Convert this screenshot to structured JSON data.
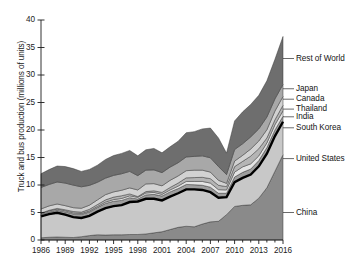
{
  "chart_data": {
    "type": "area",
    "title": "",
    "xlabel": "",
    "ylabel": "Truck and bus production (millions of units)",
    "xlim": [
      1986,
      2016
    ],
    "ylim": [
      0,
      40
    ],
    "ytick_labels": [
      "0",
      "5",
      "10",
      "15",
      "20",
      "25",
      "30",
      "35",
      "40"
    ],
    "ytick_values": [
      0,
      5,
      10,
      15,
      20,
      25,
      30,
      35,
      40
    ],
    "xtick_labels": [
      "1986",
      "1989",
      "1992",
      "1995",
      "1998",
      "2001",
      "2004",
      "2007",
      "2010",
      "2013",
      "2016"
    ],
    "xtick_values": [
      1986,
      1989,
      1992,
      1995,
      1998,
      2001,
      2004,
      2007,
      2010,
      2013,
      2016
    ],
    "grid": false,
    "legend_position": "right",
    "stacked": true,
    "x": [
      1986,
      1987,
      1988,
      1989,
      1990,
      1991,
      1992,
      1993,
      1994,
      1995,
      1996,
      1997,
      1998,
      1999,
      2000,
      2001,
      2002,
      2003,
      2004,
      2005,
      2006,
      2007,
      2008,
      2009,
      2010,
      2011,
      2012,
      2013,
      2014,
      2015,
      2016
    ],
    "series": [
      {
        "name": "China",
        "color": "#8a8a8a",
        "values": [
          0.4,
          0.5,
          0.55,
          0.5,
          0.45,
          0.6,
          0.8,
          0.95,
          0.9,
          0.95,
          0.95,
          1.0,
          1.0,
          1.1,
          1.3,
          1.5,
          1.9,
          2.3,
          2.5,
          2.4,
          2.9,
          3.3,
          3.4,
          4.6,
          6.1,
          6.3,
          6.4,
          7.6,
          9.5,
          12.5,
          15.5
        ]
      },
      {
        "name": "United States",
        "color": "#c8c8c8",
        "values": [
          3.9,
          4.2,
          4.4,
          4.1,
          3.7,
          3.4,
          3.6,
          4.2,
          4.9,
          5.2,
          5.4,
          5.9,
          6.0,
          6.4,
          6.2,
          5.7,
          6.0,
          6.2,
          6.7,
          6.8,
          6.2,
          5.4,
          4.3,
          3.2,
          4.4,
          5.0,
          5.5,
          5.8,
          6.2,
          6.4,
          6.0
        ]
      },
      {
        "name": "South Korea",
        "color": "#9e9e9e",
        "values": [
          0.35,
          0.4,
          0.45,
          0.5,
          0.6,
          0.65,
          0.7,
          0.75,
          0.85,
          0.9,
          0.85,
          0.8,
          0.45,
          0.7,
          0.8,
          0.8,
          0.85,
          0.85,
          0.9,
          0.85,
          0.85,
          0.9,
          0.8,
          0.7,
          0.95,
          1.0,
          1.0,
          1.05,
          1.1,
          1.1,
          1.0
        ]
      },
      {
        "name": "India",
        "color": "#e4e4e4",
        "values": [
          0.15,
          0.18,
          0.2,
          0.2,
          0.18,
          0.17,
          0.18,
          0.2,
          0.25,
          0.3,
          0.35,
          0.33,
          0.3,
          0.35,
          0.35,
          0.3,
          0.35,
          0.45,
          0.55,
          0.6,
          0.7,
          0.75,
          0.65,
          0.6,
          0.9,
          1.0,
          0.95,
          0.85,
          0.85,
          0.95,
          1.0
        ]
      },
      {
        "name": "Thailand",
        "color": "#b5b5b5",
        "values": [
          0.1,
          0.12,
          0.15,
          0.2,
          0.25,
          0.25,
          0.3,
          0.35,
          0.4,
          0.45,
          0.5,
          0.35,
          0.15,
          0.25,
          0.3,
          0.35,
          0.45,
          0.55,
          0.65,
          0.7,
          0.75,
          0.8,
          0.8,
          0.6,
          1.0,
          1.0,
          1.4,
          1.3,
          0.9,
          0.9,
          1.0
        ]
      },
      {
        "name": "Canada",
        "color": "#d2d2d2",
        "values": [
          0.75,
          0.8,
          0.8,
          0.75,
          0.7,
          0.7,
          0.75,
          0.85,
          0.95,
          0.95,
          1.0,
          1.1,
          1.2,
          1.4,
          1.3,
          1.2,
          1.3,
          1.3,
          1.3,
          1.35,
          1.3,
          1.2,
          0.9,
          0.6,
          1.0,
          1.1,
          1.3,
          1.4,
          1.5,
          1.6,
          1.6
        ]
      },
      {
        "name": "Japan",
        "color": "#a8a8a8",
        "values": [
          3.9,
          3.9,
          4.0,
          4.1,
          4.1,
          3.9,
          3.6,
          3.2,
          3.0,
          3.0,
          3.0,
          3.0,
          2.6,
          2.5,
          2.5,
          2.4,
          2.4,
          2.4,
          2.5,
          2.5,
          2.6,
          2.6,
          2.5,
          1.6,
          2.1,
          2.1,
          2.2,
          2.2,
          2.3,
          2.2,
          2.2
        ]
      },
      {
        "name": "Rest of World",
        "color": "#6e6e6e",
        "values": [
          2.5,
          2.7,
          2.9,
          3.0,
          3.0,
          2.8,
          2.9,
          3.1,
          3.4,
          3.6,
          3.7,
          3.8,
          3.6,
          3.7,
          3.9,
          3.6,
          3.7,
          3.9,
          4.4,
          4.5,
          4.9,
          5.4,
          5.2,
          3.9,
          5.2,
          5.8,
          5.9,
          6.1,
          6.6,
          7.2,
          8.7
        ]
      }
    ],
    "overlay_line": {
      "name": "United States cumulative boundary",
      "color": "#000000",
      "note": "heavy black line marking top of United States band"
    },
    "legend": [
      {
        "label": "Rest of World",
        "y_value": 33.0
      },
      {
        "label": "Japan",
        "y_value": 27.5
      },
      {
        "label": "Canada",
        "y_value": 25.6
      },
      {
        "label": "Thailand",
        "y_value": 23.8
      },
      {
        "label": "India",
        "y_value": 22.4
      },
      {
        "label": "South Korea",
        "y_value": 20.4
      },
      {
        "label": "United States",
        "y_value": 14.8
      },
      {
        "label": "China",
        "y_value": 5.0
      }
    ]
  }
}
